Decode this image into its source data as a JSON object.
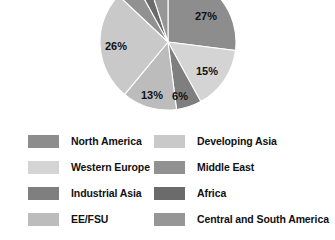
{
  "chart_data": {
    "type": "pie",
    "title": "",
    "categories": [
      "North America",
      "Western Europe",
      "Industrial Asia",
      "EE/FSU",
      "Developing Asia",
      "Middle East",
      "Africa",
      "Central and South America"
    ],
    "values": [
      27,
      15,
      6,
      13,
      26,
      5,
      3,
      5
    ],
    "value_labels": [
      "27%",
      "15%",
      "6%",
      "13%",
      "26%",
      "",
      "",
      ""
    ],
    "colors": [
      "#8d8d8d",
      "#d4d4d4",
      "#7f7f7f",
      "#bcbcbc",
      "#c9c9c9",
      "#919191",
      "#6b6b6b",
      "#969696"
    ],
    "legend_position": "bottom",
    "grid": false,
    "start_angle": 0,
    "direction": "clockwise",
    "note": "pie is cropped at the top edge of the image"
  },
  "pie": {
    "center_x": 168,
    "center_y": 42,
    "radius": 68,
    "labels": [
      {
        "text": "27%",
        "x": 206,
        "y": 17
      },
      {
        "text": "15%",
        "x": 207,
        "y": 72
      },
      {
        "text": "6%",
        "x": 180,
        "y": 97
      },
      {
        "text": "13%",
        "x": 152,
        "y": 96
      },
      {
        "text": "26%",
        "x": 116,
        "y": 47
      }
    ]
  },
  "legend": {
    "left": [
      {
        "label": "North America",
        "color": "#8d8d8d"
      },
      {
        "label": "Western Europe",
        "color": "#d4d4d4"
      },
      {
        "label": "Industrial Asia",
        "color": "#7f7f7f"
      },
      {
        "label": "EE/FSU",
        "color": "#bcbcbc"
      }
    ],
    "right": [
      {
        "label": "Developing Asia",
        "color": "#c9c9c9"
      },
      {
        "label": "Middle East",
        "color": "#919191"
      },
      {
        "label": "Africa",
        "color": "#6b6b6b"
      },
      {
        "label": "Central and South America",
        "color": "#969696"
      }
    ]
  }
}
